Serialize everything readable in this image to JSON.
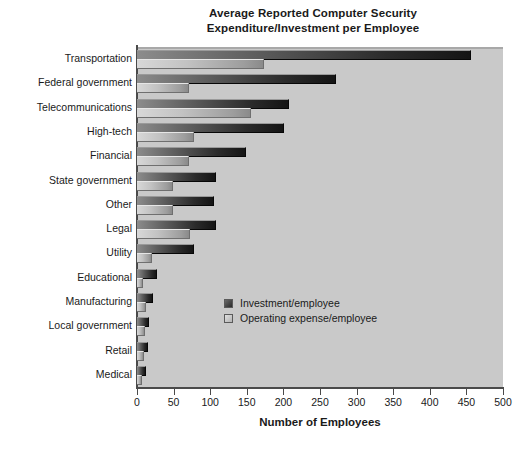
{
  "chart_data": {
    "type": "bar",
    "orientation": "horizontal",
    "title": "Average Reported Computer Security Expenditure/Investment per Employee",
    "title_lines": [
      "Average Reported Computer Security",
      "Expenditure/Investment per Employee"
    ],
    "xlabel": "Number of Employees",
    "ylabel": "",
    "xlim": [
      0,
      500
    ],
    "xticks": [
      0,
      50,
      100,
      150,
      200,
      250,
      300,
      350,
      400,
      450,
      500
    ],
    "xtick_labels": [
      "0",
      "50",
      "100",
      "150",
      "200",
      "250",
      "300",
      "350",
      "400",
      "450",
      "500"
    ],
    "grid": false,
    "legend_position": "center-right-inside",
    "categories": [
      "Transportation",
      "Federal government",
      "Telecommunications",
      "High-tech",
      "Financial",
      "State government",
      "Other",
      "Legal",
      "Utility",
      "Educational",
      "Manufacturing",
      "Local government",
      "Retail",
      "Medical"
    ],
    "series": [
      {
        "name": "Investment/employee",
        "color": "#2b2b2b",
        "values": [
          455,
          270,
          206,
          199,
          148,
          106,
          104,
          107,
          77,
          26,
          21,
          15,
          13,
          11
        ]
      },
      {
        "name": "Operating expense/employee",
        "color": "#c2c2c2",
        "values": [
          172,
          70,
          154,
          76,
          70,
          48,
          48,
          71,
          19,
          7,
          11,
          9,
          8,
          6
        ]
      }
    ]
  },
  "style": {
    "plot_background": "#c9c9c9",
    "page_background": "#ffffff",
    "axis_color": "#4a4a4a",
    "text_color": "#1a1a1a"
  }
}
